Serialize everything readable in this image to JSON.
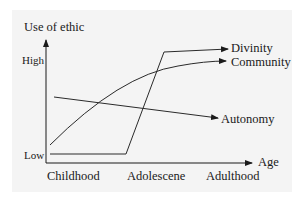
{
  "diagram": {
    "y_axis": {
      "title": "Use of ethic",
      "high_label": "High",
      "low_label": "Low"
    },
    "x_axis": {
      "title": "Age",
      "ticks": [
        "Childhood",
        "Adolescene",
        "Adulthood"
      ]
    },
    "series": [
      {
        "name": "Divinity",
        "shape": "flat low, sharp rise at adolescence, then high plateau"
      },
      {
        "name": "Community",
        "shape": "concave rising curve from low to high"
      },
      {
        "name": "Autonomy",
        "shape": "gentle linear decline"
      }
    ],
    "colors": {
      "line": "#2a2a2a",
      "background": "#f4f4f4",
      "text": "#1a1a1a"
    }
  }
}
